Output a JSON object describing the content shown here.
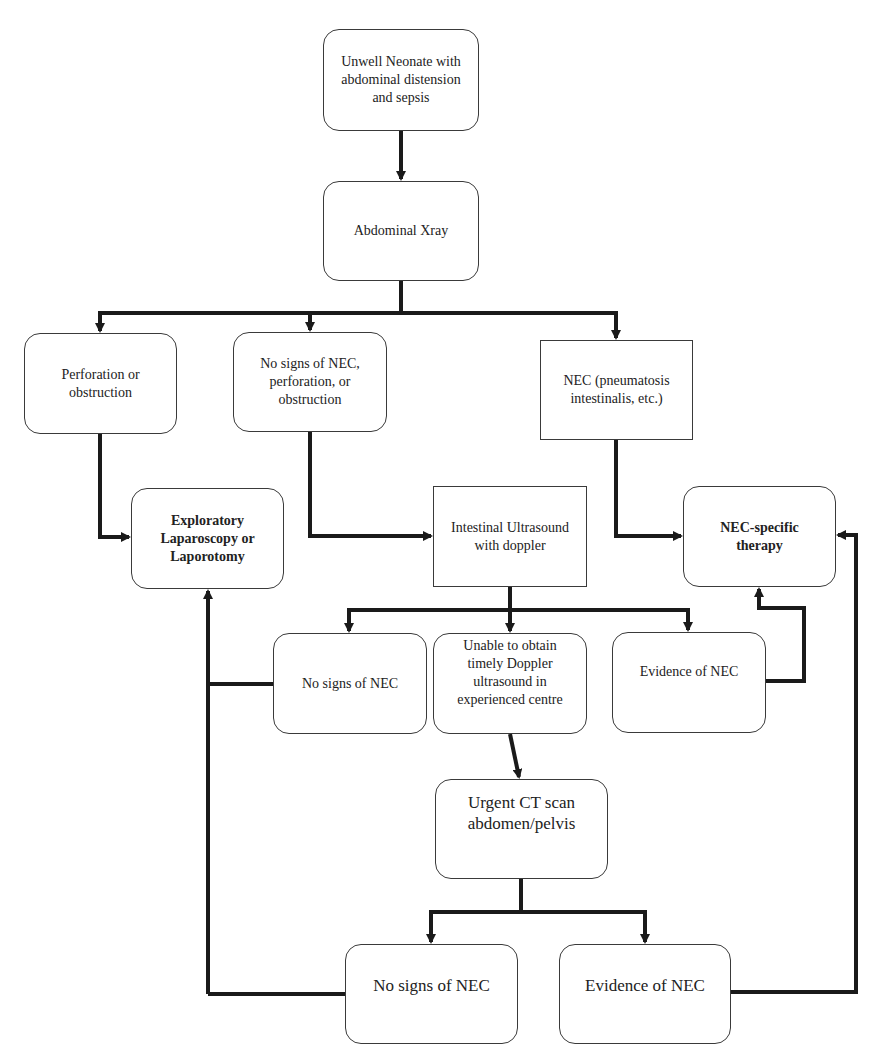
{
  "diagram": {
    "type": "flowchart",
    "nodes": {
      "start": {
        "label": "Unwell Neonate with\nabdominal distension\nand sepsis"
      },
      "xray": {
        "label": "Abdominal Xray"
      },
      "perforation": {
        "label": "Perforation or\nobstruction"
      },
      "no_signs_xray": {
        "label": "No signs of NEC,\nperforation, or\nobstruction"
      },
      "nec_xray": {
        "label": "NEC (pneumatosis\nintestinalis, etc.)"
      },
      "exploratory": {
        "label": "Exploratory\nLaparoscopy or\nLaporotomy"
      },
      "ultrasound": {
        "label": "Intestinal Ultrasound\nwith doppler"
      },
      "nec_therapy": {
        "label": "NEC-specific\ntherapy"
      },
      "us_no_signs": {
        "label": "No signs of NEC"
      },
      "us_unable": {
        "label": "Unable to obtain\ntimely Doppler\nultrasound in\nexperienced centre"
      },
      "us_evidence": {
        "label": "Evidence of NEC"
      },
      "ct": {
        "label": "Urgent CT scan\nabdomen/pelvis"
      },
      "ct_no_signs": {
        "label": "No signs of NEC"
      },
      "ct_evidence": {
        "label": "Evidence of NEC"
      }
    },
    "edges": [
      [
        "start",
        "xray"
      ],
      [
        "xray",
        "perforation"
      ],
      [
        "xray",
        "no_signs_xray"
      ],
      [
        "xray",
        "nec_xray"
      ],
      [
        "perforation",
        "exploratory"
      ],
      [
        "no_signs_xray",
        "ultrasound"
      ],
      [
        "nec_xray",
        "nec_therapy"
      ],
      [
        "ultrasound",
        "us_no_signs"
      ],
      [
        "ultrasound",
        "us_unable"
      ],
      [
        "ultrasound",
        "us_evidence"
      ],
      [
        "us_evidence",
        "nec_therapy"
      ],
      [
        "us_no_signs",
        "exploratory"
      ],
      [
        "us_unable",
        "ct"
      ],
      [
        "ct",
        "ct_no_signs"
      ],
      [
        "ct",
        "ct_evidence"
      ],
      [
        "ct_no_signs",
        "exploratory"
      ],
      [
        "ct_evidence",
        "nec_therapy"
      ]
    ],
    "colors": {
      "stroke": "#1a1a1a",
      "box_border": "#3a3a3a",
      "background": "#ffffff"
    }
  }
}
